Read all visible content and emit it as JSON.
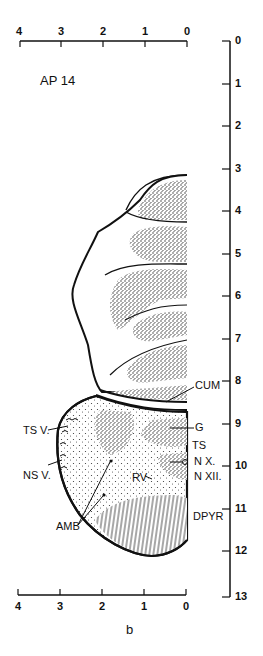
{
  "figure": {
    "section_label": "AP 14",
    "caption": "b",
    "top_scale": {
      "ticks": [
        "4",
        "3",
        "2",
        "1",
        "0"
      ]
    },
    "bottom_scale": {
      "ticks": [
        "4",
        "3",
        "2",
        "1",
        "0"
      ]
    },
    "vertical_scale": {
      "ticks": [
        "0",
        "1",
        "2",
        "3",
        "4",
        "5",
        "6",
        "7",
        "8",
        "9",
        "10",
        "11",
        "12",
        "13"
      ]
    },
    "structure_labels": {
      "cum": "CUM",
      "g": "G",
      "ts": "TS",
      "nx": "N X.",
      "nxii": "N XII.",
      "dpyr": "DPYR",
      "tsv": "TS V.",
      "nsv": "NS V.",
      "rv": "RV",
      "amb": "AMB"
    },
    "colors": {
      "ink": "#111111",
      "paper": "#ffffff"
    }
  }
}
